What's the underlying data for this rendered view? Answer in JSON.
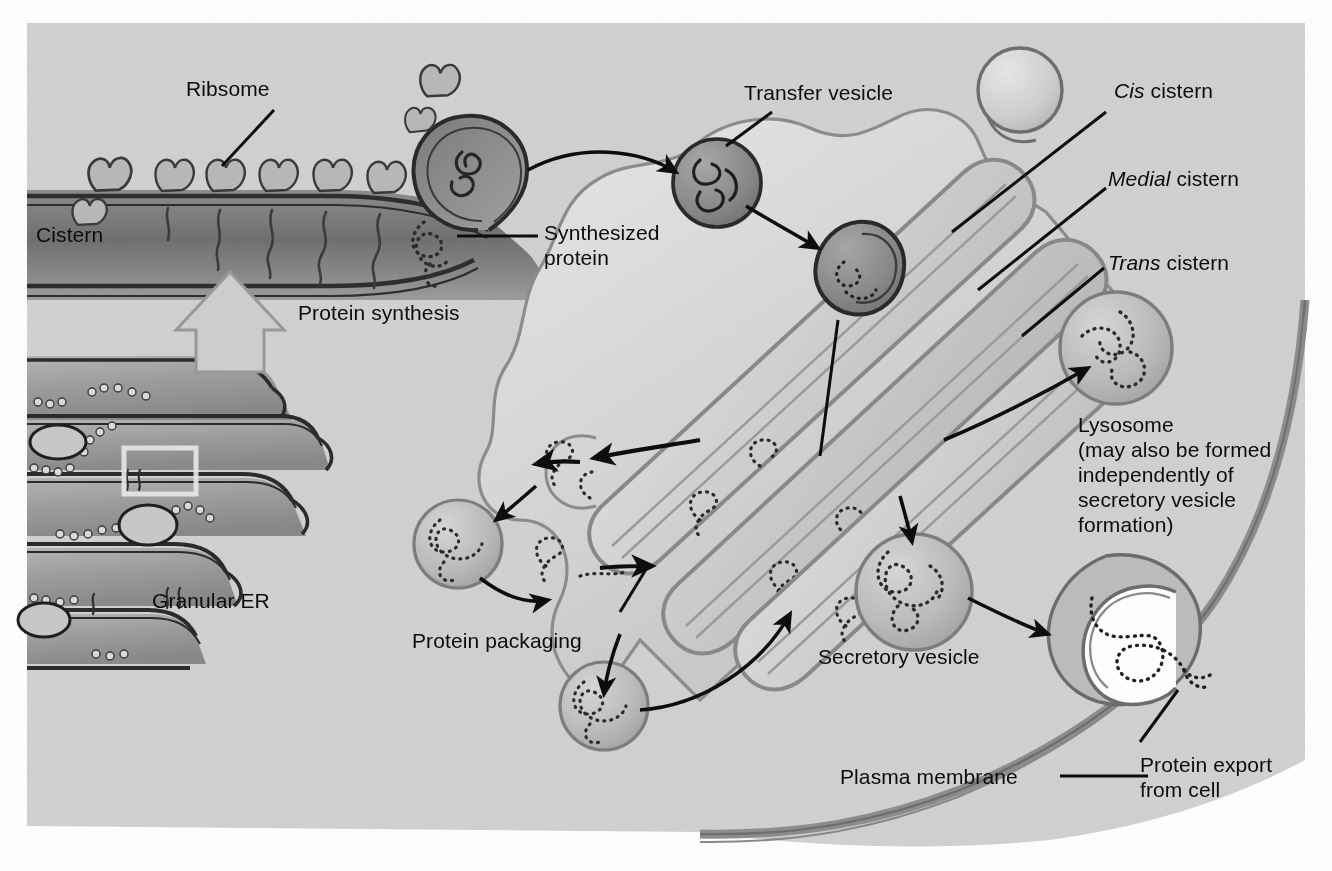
{
  "figure": {
    "background_color": "#d2d2d2",
    "ink_color": "#111111",
    "margin_color": "#ffffff"
  },
  "labels": {
    "ribosome": "Ribsome",
    "cistern": "Cistern",
    "synthesized_protein": "Synthesized\nprotein",
    "protein_synthesis": "Protein synthesis",
    "granular_er": "Granular ER",
    "transfer_vesicle": "Transfer vesicle",
    "cis_cistern_em": "Cis",
    "cis_cistern_rest": " cistern",
    "medial_cistern_em": "Medial",
    "medial_cistern_rest": " cistern",
    "trans_cistern_em": "Trans",
    "trans_cistern_rest": " cistern",
    "lysosome": "Lysosome\n(may also be formed\nindependently of\nsecretory vesicle\nformation)",
    "protein_packaging": "Protein packaging",
    "secretory_vesicle": "Secretory vesicle",
    "plasma_membrane": "Plasma membrane",
    "protein_export": "Protein export\nfrom cell"
  }
}
